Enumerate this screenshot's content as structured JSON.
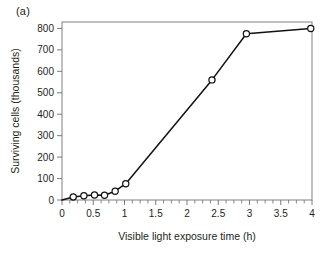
{
  "panel": {
    "label": "(a)"
  },
  "chart_data": {
    "type": "line",
    "title": "",
    "xlabel": "Visible light exposure time (h)",
    "ylabel": "Surviving cells (thousands)",
    "xlim": [
      0,
      4
    ],
    "ylim": [
      0,
      830
    ],
    "grid": false,
    "legend": false,
    "x_major_ticks": [
      0,
      0.5,
      1,
      1.5,
      2,
      2.5,
      3,
      3.5,
      4
    ],
    "x_tick_labels": [
      "0",
      "0.5",
      "1",
      "1.5",
      "2",
      "2.5",
      "3",
      "3.5",
      "4"
    ],
    "x_minor_tick_step": 0.125,
    "y_major_ticks": [
      0,
      100,
      200,
      300,
      400,
      500,
      600,
      700,
      800
    ],
    "y_tick_labels": [
      "0",
      "100",
      "200",
      "300",
      "400",
      "500",
      "600",
      "700",
      "800"
    ],
    "marker_style": "open-circle",
    "line_color": "#111111",
    "marker_fill": "#ffffff",
    "frame_color": "#8c8c8c",
    "origin_point": {
      "x": 0,
      "y": 0,
      "marker": false
    },
    "x": [
      0,
      0.18,
      0.35,
      0.52,
      0.68,
      0.85,
      1.02,
      2.4,
      2.95,
      3.98
    ],
    "values": [
      0,
      14,
      20,
      23,
      22,
      41,
      76,
      560,
      775,
      800
    ],
    "points": [
      {
        "x": 0,
        "y": 0,
        "marker": false
      },
      {
        "x": 0.18,
        "y": 14,
        "marker": true
      },
      {
        "x": 0.35,
        "y": 20,
        "marker": true
      },
      {
        "x": 0.52,
        "y": 23,
        "marker": true
      },
      {
        "x": 0.68,
        "y": 22,
        "marker": true
      },
      {
        "x": 0.85,
        "y": 41,
        "marker": true
      },
      {
        "x": 1.02,
        "y": 76,
        "marker": true
      },
      {
        "x": 2.4,
        "y": 560,
        "marker": true
      },
      {
        "x": 2.95,
        "y": 775,
        "marker": true
      },
      {
        "x": 3.98,
        "y": 800,
        "marker": true
      }
    ]
  }
}
